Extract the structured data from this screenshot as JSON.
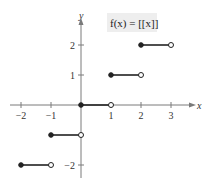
{
  "chart_data": {
    "type": "line",
    "title": "f(x) = [[x]]",
    "function_label": "f(x) = [[x]]",
    "xlabel": "x",
    "ylabel": "y",
    "xlim": [
      -2.5,
      3.5
    ],
    "ylim": [
      -2.5,
      2.5
    ],
    "x_ticks": [
      -2,
      -1,
      1,
      2,
      3
    ],
    "y_ticks": [
      -2,
      1,
      2
    ],
    "x_tick_labels": [
      "−2",
      "−1",
      "1",
      "2",
      "3"
    ],
    "y_tick_labels": [
      "−2",
      "1",
      "2"
    ],
    "grid": false,
    "legend": null,
    "segments": [
      {
        "x_start": -2,
        "x_end": -1,
        "y": -2,
        "start_closed": true,
        "end_closed": false
      },
      {
        "x_start": -1,
        "x_end": 0,
        "y": -1,
        "start_closed": true,
        "end_closed": false
      },
      {
        "x_start": 0,
        "x_end": 1,
        "y": 0,
        "start_closed": true,
        "end_closed": false
      },
      {
        "x_start": 1,
        "x_end": 2,
        "y": 1,
        "start_closed": true,
        "end_closed": false
      },
      {
        "x_start": 2,
        "x_end": 3,
        "y": 2,
        "start_closed": true,
        "end_closed": false
      }
    ]
  },
  "colors": {
    "axis": "#7a7a7a",
    "segment": "#222222",
    "label_bg": "#eeeeee"
  }
}
